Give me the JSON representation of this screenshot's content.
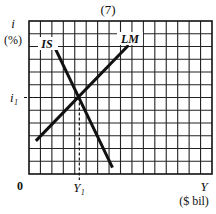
{
  "chart_data": {
    "type": "line",
    "title": "(7)",
    "xlabel": "Y",
    "xlabel_unit": "($ bil)",
    "ylabel": "i",
    "ylabel_unit": "(%)",
    "origin_label": "0",
    "grid": true,
    "grid_columns": 16,
    "grid_rows": 12,
    "xlim": [
      0,
      16
    ],
    "ylim": [
      0,
      12
    ],
    "series": [
      {
        "name": "IS",
        "label": "IS",
        "points": [
          [
            2.1,
            10.2
          ],
          [
            7.3,
            0.5
          ]
        ]
      },
      {
        "name": "LM",
        "label": "LM",
        "points": [
          [
            0.6,
            2.6
          ],
          [
            8.7,
            10.1
          ]
        ]
      }
    ],
    "equilibrium": {
      "x_label": "Y₁",
      "y_label": "i₁",
      "x": 4.4,
      "y": 6.0
    },
    "caption_partial": "FIGURE 11-11 (Continued)"
  }
}
